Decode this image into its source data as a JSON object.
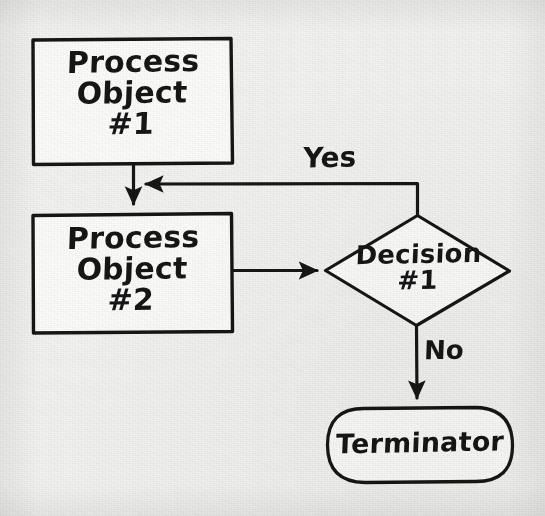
{
  "diagram": {
    "kind": "flowchart",
    "style": "hand-drawn pencil sketch on paper",
    "background_color": "#f2f2f1",
    "ink_color": "#161616",
    "nodes": [
      {
        "id": "process-object-1",
        "shape": "rectangle",
        "label": "Process\nObject\n#1",
        "label_lines": [
          "Process",
          "Object",
          "#1"
        ],
        "x": 32,
        "y": 38,
        "width": 200,
        "height": 127
      },
      {
        "id": "process-object-2",
        "shape": "rectangle",
        "label": "Process\nObject\n#2",
        "label_lines": [
          "Process",
          "Object",
          "#2"
        ],
        "x": 32,
        "y": 213,
        "width": 200,
        "height": 120
      },
      {
        "id": "decision-1",
        "shape": "diamond",
        "label": "Decision\n#1",
        "label_lines": [
          "Decision",
          "#1"
        ],
        "x": 325,
        "y": 215,
        "width": 185,
        "height": 110
      },
      {
        "id": "terminator",
        "shape": "stadium",
        "label": "Terminator",
        "label_lines": [
          "Terminator"
        ],
        "x": 327,
        "y": 407,
        "width": 186,
        "height": 76
      }
    ],
    "edges": [
      {
        "id": "edge-process1-to-process2",
        "from": "process-object-1",
        "to": "process-object-2",
        "label": "",
        "arrow": "down"
      },
      {
        "id": "edge-decision-yes-to-process2",
        "from": "decision-1",
        "to": "process-object-2",
        "label": "Yes",
        "arrow": "left",
        "routing": "up-then-left"
      },
      {
        "id": "edge-process2-to-decision",
        "from": "process-object-2",
        "to": "decision-1",
        "label": "",
        "arrow": "right"
      },
      {
        "id": "edge-decision-no-to-terminator",
        "from": "decision-1",
        "to": "terminator",
        "label": "No",
        "arrow": "down"
      }
    ],
    "edge_labels": [
      {
        "id": "label-yes",
        "text": "Yes",
        "x": 303,
        "y": 142,
        "font_size": 27
      },
      {
        "id": "label-no",
        "text": "No",
        "x": 424,
        "y": 336,
        "font_size": 25
      }
    ]
  }
}
